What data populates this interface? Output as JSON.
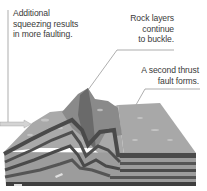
{
  "diagram": {
    "colors": {
      "background": "#ffffff",
      "text": "#3a3a3a",
      "leader_line": "#555555",
      "surface_light": "#b8b8b8",
      "surface_mid": "#9a9a9a",
      "mountain_dark": "#6e6e6e",
      "layer_dark": "#4a4a4a",
      "layer_light": "#9c9c9c",
      "arrow": "#d8d8d8"
    },
    "labels": [
      {
        "id": "additional",
        "lines": [
          "Additional",
          "squeezing results",
          "in more faulting."
        ]
      },
      {
        "id": "rock",
        "lines": [
          "Rock layers",
          "continue",
          "to buckle."
        ]
      },
      {
        "id": "second",
        "lines": [
          "A second thrust",
          "fault forms."
        ]
      }
    ],
    "arrows": [
      {
        "id": "compression-arrow-left",
        "direction": "right"
      },
      {
        "id": "fault-slip-arrow-lower",
        "direction": "right"
      },
      {
        "id": "fault-slip-arrow-upper",
        "direction": "up-right"
      }
    ]
  }
}
